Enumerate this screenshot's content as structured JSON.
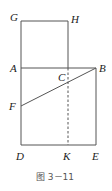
{
  "figure": {
    "caption": "图 3－11",
    "stroke_color": "#555555",
    "points": {
      "G": {
        "label": "G",
        "x": 21,
        "y": 21
      },
      "H": {
        "label": "H",
        "x": 68,
        "y": 21
      },
      "A": {
        "label": "A",
        "x": 21,
        "y": 68
      },
      "C": {
        "label": "C",
        "x": 68,
        "y": 68
      },
      "B": {
        "label": "B",
        "x": 96,
        "y": 68
      },
      "F": {
        "label": "F",
        "x": 21,
        "y": 106
      },
      "D": {
        "label": "D",
        "x": 21,
        "y": 145
      },
      "K": {
        "label": "K",
        "x": 68,
        "y": 145
      },
      "E": {
        "label": "E",
        "x": 96,
        "y": 145
      }
    },
    "segments": [
      {
        "from": "G",
        "to": "H",
        "style": "solid"
      },
      {
        "from": "G",
        "to": "A",
        "style": "solid"
      },
      {
        "from": "H",
        "to": "C",
        "style": "solid"
      },
      {
        "from": "A",
        "to": "B",
        "style": "solid"
      },
      {
        "from": "A",
        "to": "D",
        "style": "solid"
      },
      {
        "from": "B",
        "to": "E",
        "style": "solid"
      },
      {
        "from": "D",
        "to": "E",
        "style": "solid"
      },
      {
        "from": "F",
        "to": "B",
        "style": "solid"
      },
      {
        "from": "C",
        "to": "K",
        "style": "dashed"
      }
    ]
  }
}
